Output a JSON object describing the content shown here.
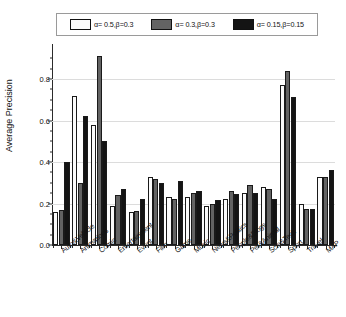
{
  "chart_data": {
    "type": "bar",
    "title": "",
    "xlabel": "",
    "ylabel": "Average Precision",
    "ylim": [
      0.0,
      0.95
    ],
    "yticks": [
      "0.0",
      "0.2",
      "0.4",
      "0.6",
      "0.8"
    ],
    "ytick_values": [
      0.0,
      0.2,
      0.4,
      0.6,
      0.8
    ],
    "grid": true,
    "legend_position": "top",
    "categories": [
      "Auto&Vehicle",
      "Animations",
      "Comic",
      "Entertainment",
      "Event",
      "Film",
      "Game",
      "Music",
      "News&Politics",
      "People&Blogs",
      "Pet&Animal",
      "Scie&Tech",
      "Sport",
      "Travel",
      "MAP"
    ],
    "series": [
      {
        "name": "α= 0.5,β=0.3",
        "color": "#fbfbfb",
        "values": [
          0.16,
          0.72,
          0.58,
          0.19,
          0.16,
          0.33,
          0.23,
          0.23,
          0.19,
          0.22,
          0.25,
          0.28,
          0.77,
          0.2,
          0.33
        ]
      },
      {
        "name": "α= 0.3,β=0.3",
        "color": "#636363",
        "values": [
          0.17,
          0.3,
          0.91,
          0.24,
          0.165,
          0.32,
          0.22,
          0.25,
          0.2,
          0.26,
          0.29,
          0.27,
          0.84,
          0.175,
          0.33
        ]
      },
      {
        "name": "α= 0.15,β=0.15",
        "color": "#141414",
        "values": [
          0.4,
          0.62,
          0.5,
          0.27,
          0.22,
          0.3,
          0.31,
          0.26,
          0.215,
          0.245,
          0.25,
          0.22,
          0.715,
          0.175,
          0.36
        ]
      }
    ]
  },
  "legend": {
    "items": [
      {
        "label": "α= 0.5,β=0.3",
        "swatch": "#fbfbfb"
      },
      {
        "label": "α= 0.3,β=0.3",
        "swatch": "#636363"
      },
      {
        "label": "α= 0.15,β=0.15",
        "swatch": "#141414"
      }
    ]
  },
  "axes": {
    "y_axis_title": "Average Precision"
  }
}
